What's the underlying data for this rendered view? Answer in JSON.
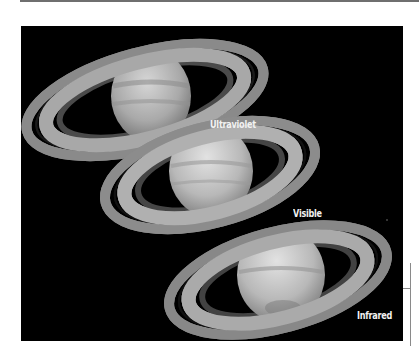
{
  "figure": {
    "background_color": "#000000",
    "panels": [
      {
        "label": "Ultraviolet"
      },
      {
        "label": "Visible"
      },
      {
        "label": "Infrared"
      }
    ]
  }
}
